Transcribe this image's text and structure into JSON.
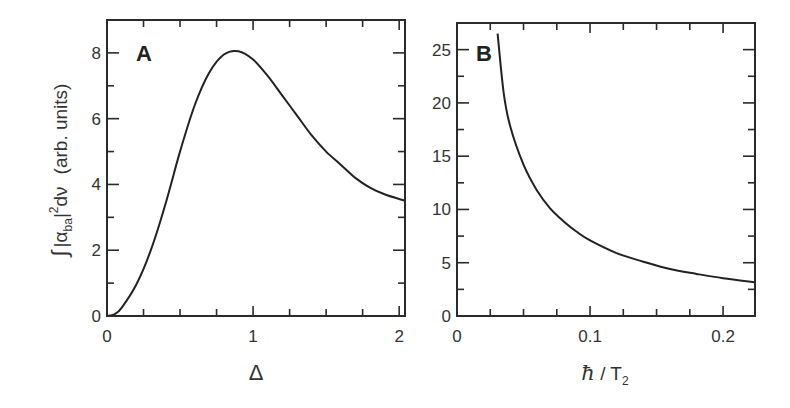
{
  "chart_data": [
    {
      "panel": "A",
      "type": "line",
      "title": "",
      "panel_label": "A",
      "xlabel": "Δ",
      "ylabel": "∫|α_ba|² dν  (arb. units)",
      "xlim": [
        0,
        2.04
      ],
      "ylim": [
        0,
        9
      ],
      "xticks": [
        0,
        1,
        2
      ],
      "xtick_labels": [
        "0",
        "1",
        "2"
      ],
      "yticks": [
        0,
        2,
        4,
        6,
        8
      ],
      "ytick_labels": [
        "0",
        "2",
        "4",
        "6",
        "8"
      ],
      "grid": false,
      "series": [
        {
          "name": "integrated absorption",
          "x": [
            0,
            0.05,
            0.1,
            0.2,
            0.3,
            0.4,
            0.5,
            0.6,
            0.7,
            0.8,
            0.9,
            1.0,
            1.1,
            1.2,
            1.3,
            1.4,
            1.5,
            1.6,
            1.7,
            1.8,
            1.9,
            2.04
          ],
          "values": [
            0,
            0.05,
            0.25,
            0.95,
            2.0,
            3.4,
            5.0,
            6.4,
            7.4,
            7.95,
            8.05,
            7.8,
            7.3,
            6.7,
            6.1,
            5.5,
            5.0,
            4.6,
            4.2,
            3.9,
            3.7,
            3.5
          ]
        }
      ]
    },
    {
      "panel": "B",
      "type": "line",
      "title": "",
      "panel_label": "B",
      "xlabel": "ħ / T₂",
      "ylabel": "",
      "xlim": [
        0,
        0.224
      ],
      "ylim": [
        0,
        27.5
      ],
      "xticks": [
        0,
        0.1,
        0.2
      ],
      "xtick_labels": [
        "0",
        "0.1",
        "0.2"
      ],
      "yticks": [
        0,
        5,
        10,
        15,
        20,
        25
      ],
      "ytick_labels": [
        "0",
        "5",
        "10",
        "15",
        "20",
        "25"
      ],
      "grid": false,
      "series": [
        {
          "name": "integrated absorption vs linewidth",
          "x": [
            0.0305,
            0.035,
            0.04,
            0.05,
            0.06,
            0.07,
            0.08,
            0.09,
            0.1,
            0.12,
            0.14,
            0.16,
            0.18,
            0.2,
            0.224
          ],
          "values": [
            26.5,
            21.0,
            17.8,
            14.2,
            11.8,
            10.1,
            8.9,
            7.9,
            7.1,
            5.9,
            5.1,
            4.4,
            3.95,
            3.55,
            3.15
          ]
        }
      ]
    }
  ]
}
